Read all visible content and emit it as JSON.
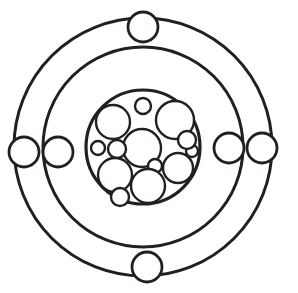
{
  "figure": {
    "width": 298,
    "height": 293,
    "background_color": "#ffffff",
    "line_color": "#231f20"
  },
  "nucleus": {
    "label": "nucleus",
    "center_x": 143,
    "center_y": 147,
    "radius": 57,
    "stroke_width": 3.2,
    "nucleon_count": 13,
    "nucleon_stroke_width": 2.4,
    "nucleons": [
      {
        "name": "nucleon-upper-left-large",
        "cx": 113,
        "cy": 122,
        "r": 17
      },
      {
        "name": "nucleon-top-small",
        "cx": 143,
        "cy": 106,
        "r": 8
      },
      {
        "name": "nucleon-upper-right-large",
        "cx": 175,
        "cy": 120,
        "r": 19
      },
      {
        "name": "nucleon-center-large",
        "cx": 142,
        "cy": 148,
        "r": 19
      },
      {
        "name": "nucleon-left-small",
        "cx": 98,
        "cy": 148,
        "r": 7
      },
      {
        "name": "nucleon-left-mid-small",
        "cx": 117,
        "cy": 149,
        "r": 9
      },
      {
        "name": "nucleon-right-upper-small",
        "cx": 187,
        "cy": 140,
        "r": 9
      },
      {
        "name": "nucleon-right-large",
        "cx": 178,
        "cy": 168,
        "r": 15
      },
      {
        "name": "nucleon-right-tiny",
        "cx": 155,
        "cy": 166,
        "r": 7
      },
      {
        "name": "nucleon-lower-left-large",
        "cx": 115,
        "cy": 175,
        "r": 17
      },
      {
        "name": "nucleon-lower-center-large",
        "cx": 148,
        "cy": 186,
        "r": 17
      },
      {
        "name": "nucleon-bottom-small",
        "cx": 120,
        "cy": 197,
        "r": 9
      },
      {
        "name": "nucleon-far-right-small",
        "cx": 192,
        "cy": 151,
        "r": 6
      }
    ]
  },
  "orbits": [
    {
      "name": "inner-shell",
      "label": "inner electron shell",
      "radius": 100,
      "stroke_width": 3.0,
      "electron_count": 2
    },
    {
      "name": "outer-shell",
      "label": "outer electron shell",
      "radius": 129,
      "stroke_width": 3.0,
      "electron_count": 4
    }
  ],
  "electrons": [
    {
      "name": "electron-outer-top",
      "shell": "outer-shell",
      "cx": 143,
      "cy": 27,
      "r": 15,
      "angle_deg": 90
    },
    {
      "name": "electron-outer-bottom",
      "shell": "outer-shell",
      "cx": 147,
      "cy": 267,
      "r": 15,
      "angle_deg": 270
    },
    {
      "name": "electron-outer-left",
      "shell": "outer-shell",
      "cx": 24,
      "cy": 152,
      "r": 15,
      "angle_deg": 180
    },
    {
      "name": "electron-outer-right",
      "shell": "outer-shell",
      "cx": 262,
      "cy": 148,
      "r": 15,
      "angle_deg": 0
    },
    {
      "name": "electron-inner-left",
      "shell": "inner-shell",
      "cx": 58,
      "cy": 152,
      "r": 15,
      "angle_deg": 180
    },
    {
      "name": "electron-inner-right",
      "shell": "inner-shell",
      "cx": 229,
      "cy": 148,
      "r": 15,
      "angle_deg": 0
    }
  ],
  "electron_stroke_width": 2.8,
  "counts": {
    "total_electrons": 6,
    "total_nucleons": 13,
    "total_shells": 2
  }
}
